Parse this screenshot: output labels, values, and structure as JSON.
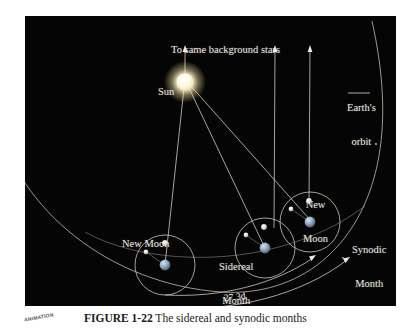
{
  "figure": {
    "background_color": "#050505",
    "line_color": "#cfcbc2",
    "label_color": "#e8e6e0",
    "labels": {
      "background_stars": "To same background stars",
      "sun": "Sun",
      "earths_orbit_line1": "Earth's",
      "earths_orbit_line2": "orbit",
      "new_moon_left": "New Moon",
      "sidereal_line1": "Sidereal",
      "sidereal_line2": "Month",
      "new_moon_right_line1": "New",
      "new_moon_right_line2": "Moon",
      "synodic_line1": "Synodic",
      "synodic_line2": "Month",
      "sidereal_period": "27.3d",
      "synodic_period": "29.5d"
    },
    "bodies": {
      "sun": {
        "name": "Sun",
        "color": "#fff6d8",
        "cx": 185,
        "cy": 82,
        "r": 8
      },
      "earth_1": {
        "name": "Earth position 1",
        "color": "#8fa6bd",
        "cx": 165,
        "cy": 265,
        "r": 5
      },
      "earth_2": {
        "name": "Earth position 2",
        "color": "#8fa6bd",
        "cx": 265,
        "cy": 248,
        "r": 5
      },
      "earth_3": {
        "name": "Earth position 3",
        "color": "#8fa6bd",
        "cx": 310,
        "cy": 222,
        "r": 5
      },
      "moon_1": {
        "name": "Moon new at position 1",
        "color": "#dedad2",
        "cx": 165,
        "cy": 243,
        "r": 2.6
      },
      "moon_2": {
        "name": "Moon sidereal at position 2",
        "color": "#dedad2",
        "cx": 264,
        "cy": 227,
        "r": 2.6
      },
      "moon_3": {
        "name": "Moon synodic at position 3",
        "color": "#dedad2",
        "cx": 309,
        "cy": 201,
        "r": 2.6
      },
      "moon_1b": {
        "name": "Moon marker left of Earth 1",
        "color": "#bdb9b1",
        "cx": 146,
        "cy": 252,
        "r": 2.1
      },
      "moon_2b": {
        "name": "Moon marker left of Earth 2",
        "color": "#bdb9b1",
        "cx": 246,
        "cy": 236,
        "r": 2.1
      },
      "moon_3b": {
        "name": "Moon marker left of Earth 3",
        "color": "#bdb9b1",
        "cx": 291,
        "cy": 210,
        "r": 2.1
      }
    },
    "moon_orbits": [
      {
        "name": "moon-orbit-1",
        "cx": 165,
        "cy": 265,
        "r": 22
      },
      {
        "name": "moon-orbit-2",
        "cx": 265,
        "cy": 248,
        "r": 22
      },
      {
        "name": "moon-orbit-3",
        "cx": 310,
        "cy": 222,
        "r": 22
      }
    ],
    "star_rays": [
      {
        "name": "star-ray-1",
        "x": 185,
        "y_top": 48,
        "y_bottom": 78
      },
      {
        "name": "star-ray-2",
        "x": 275,
        "y_top": 48,
        "y_bottom": 228
      },
      {
        "name": "star-ray-3",
        "x": 310,
        "y_top": 48,
        "y_bottom": 203
      }
    ],
    "sun_rays": [
      {
        "name": "sun-ray-to-earth-1",
        "x1": 186,
        "y1": 90,
        "x2": 165,
        "y2": 262
      },
      {
        "name": "sun-ray-to-earth-2",
        "x1": 190,
        "y1": 89,
        "x2": 265,
        "y2": 245
      },
      {
        "name": "sun-ray-to-earth-3",
        "x1": 191,
        "y1": 88,
        "x2": 312,
        "y2": 219
      }
    ]
  },
  "caption": {
    "badge": "ANIMATION",
    "text_prefix": "FIGURE 1-22",
    "text_body": "  The sidereal and synodic months"
  }
}
